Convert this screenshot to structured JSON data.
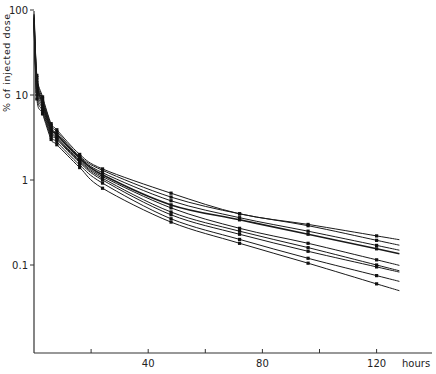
{
  "chart_data": {
    "type": "line",
    "title": "",
    "xlabel": "hours",
    "ylabel": "% of injected dose",
    "yscale": "log",
    "xlim": [
      0,
      130
    ],
    "ylim": [
      0.01,
      100
    ],
    "x_ticks": [
      20,
      40,
      60,
      80,
      100,
      120
    ],
    "x_tick_labels": [
      "",
      "40",
      "",
      "80",
      "",
      "120"
    ],
    "y_ticks": [
      100,
      10,
      1,
      0.1
    ],
    "y_tick_labels": [
      "100",
      "10",
      "1",
      "0.1"
    ],
    "grid": false,
    "legend": null,
    "x": [
      1,
      3,
      6,
      8,
      16,
      24,
      48,
      72,
      96,
      120
    ],
    "series": [
      {
        "name": "subject 1",
        "values": [
          17,
          9.5,
          4.6,
          3.9,
          2.0,
          1.35,
          0.7,
          0.4,
          0.3,
          0.22
        ]
      },
      {
        "name": "subject 2",
        "values": [
          16,
          9.0,
          4.4,
          3.7,
          1.9,
          1.3,
          0.63,
          0.4,
          0.29,
          0.195
        ]
      },
      {
        "name": "subject 3",
        "values": [
          15,
          8.5,
          4.2,
          3.5,
          1.85,
          1.22,
          0.57,
          0.36,
          0.25,
          0.17
        ]
      },
      {
        "name": "subject 4",
        "values": [
          14,
          8.0,
          4.0,
          3.4,
          1.8,
          1.15,
          0.51,
          0.34,
          0.23,
          0.155
        ]
      },
      {
        "name": "subject 5",
        "values": [
          13,
          7.6,
          3.8,
          3.2,
          1.7,
          1.1,
          0.47,
          0.27,
          0.18,
          0.115
        ]
      },
      {
        "name": "subject 6",
        "values": [
          12,
          7.2,
          3.6,
          3.1,
          1.65,
          1.05,
          0.42,
          0.25,
          0.16,
          0.1
        ]
      },
      {
        "name": "subject 7",
        "values": [
          11,
          6.8,
          3.4,
          3.0,
          1.6,
          1.0,
          0.39,
          0.23,
          0.145,
          0.095
        ]
      },
      {
        "name": "subject 8",
        "values": [
          10,
          6.4,
          3.2,
          2.8,
          1.5,
          0.92,
          0.35,
          0.2,
          0.12,
          0.075
        ]
      },
      {
        "name": "subject 9",
        "values": [
          9,
          6.0,
          3.0,
          2.6,
          1.4,
          0.8,
          0.32,
          0.18,
          0.105,
          0.06
        ]
      }
    ],
    "annotations": []
  },
  "axes": {
    "x_title": "hours",
    "y_title": "% of injected dose"
  }
}
